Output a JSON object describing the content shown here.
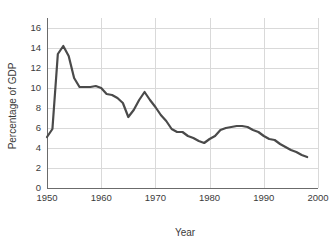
{
  "chart_data": {
    "type": "line",
    "title": "",
    "xlabel": "Year",
    "ylabel": "Percentage of GDP",
    "xlim": [
      1950,
      2000
    ],
    "ylim": [
      0,
      17
    ],
    "grid": true,
    "legend": null,
    "line_color": "#4a4a4a",
    "grid_color": "#d9d9d9",
    "axis_color": "#6b6b6b",
    "xticks": [
      1950,
      1960,
      1970,
      1980,
      1990,
      2000
    ],
    "xtick_labels": [
      "1950",
      "1960",
      "1970",
      "1980",
      "1990",
      "2000"
    ],
    "yticks": [
      0,
      2,
      4,
      6,
      8,
      10,
      12,
      14,
      16
    ],
    "ytick_labels": [
      "0",
      "2",
      "4",
      "6",
      "8",
      "10",
      "12",
      "14",
      "16"
    ],
    "x": [
      1950,
      1951,
      1952,
      1953,
      1954,
      1955,
      1956,
      1957,
      1958,
      1959,
      1960,
      1961,
      1962,
      1963,
      1964,
      1965,
      1966,
      1967,
      1968,
      1969,
      1970,
      1971,
      1972,
      1973,
      1974,
      1975,
      1976,
      1977,
      1978,
      1979,
      1980,
      1981,
      1982,
      1983,
      1984,
      1985,
      1986,
      1987,
      1988,
      1989,
      1990,
      1991,
      1992,
      1993,
      1994,
      1995,
      1996,
      1997,
      1998
    ],
    "y": [
      5.1,
      5.9,
      13.4,
      14.2,
      13.2,
      11.0,
      10.1,
      10.1,
      10.1,
      10.2,
      10.0,
      9.4,
      9.3,
      9.0,
      8.5,
      7.1,
      7.8,
      8.8,
      9.6,
      8.8,
      8.1,
      7.3,
      6.7,
      5.9,
      5.6,
      5.6,
      5.2,
      5.0,
      4.7,
      4.5,
      4.9,
      5.2,
      5.8,
      6.0,
      6.1,
      6.2,
      6.2,
      6.1,
      5.8,
      5.6,
      5.2,
      4.9,
      4.8,
      4.4,
      4.1,
      3.8,
      3.6,
      3.3,
      3.1
    ],
    "series_name": "Defense spending"
  },
  "axis_labels": {
    "x_title": "Year",
    "y_title": "Percentage of GDP"
  }
}
